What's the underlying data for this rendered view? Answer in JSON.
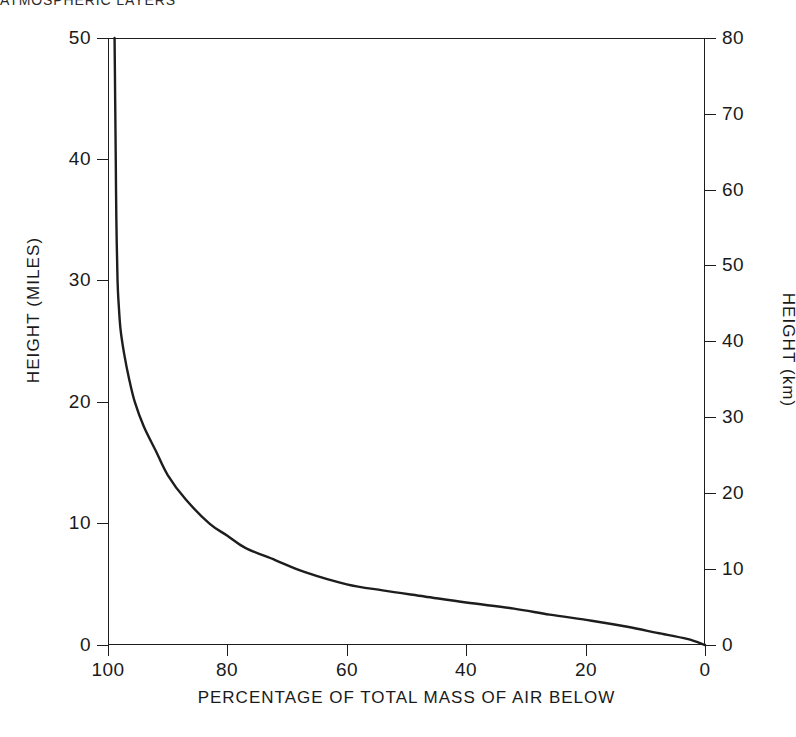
{
  "caption": {
    "text": "ATMOSPHERIC LAYERS"
  },
  "chart_data": {
    "type": "line",
    "title": "",
    "xlabel": "PERCENTAGE OF TOTAL MASS OF AIR BELOW",
    "ylabel": "HEIGHT (MILES)",
    "ylabel_secondary": "HEIGHT (km)",
    "xlim": [
      100,
      0
    ],
    "ylim": [
      0,
      50
    ],
    "ylim_secondary": [
      0,
      80
    ],
    "x_ticks": [
      100,
      80,
      60,
      40,
      20,
      0
    ],
    "x_tick_labels": [
      "100",
      "80",
      "60",
      "40",
      "20",
      "0"
    ],
    "y_ticks_left": [
      0,
      10,
      20,
      30,
      40,
      50
    ],
    "y_tick_labels_left": [
      "0",
      "10",
      "20",
      "30",
      "40",
      "50"
    ],
    "y_ticks_right": [
      0,
      10,
      20,
      30,
      40,
      50,
      60,
      70,
      80
    ],
    "y_tick_labels_right": [
      "0",
      "10",
      "20",
      "30",
      "40",
      "50",
      "60",
      "70",
      "80"
    ],
    "grid": false,
    "legend": "none",
    "line_color": "#1d1d1d",
    "series": [
      {
        "name": "Percentage of total atmospheric mass below a given height",
        "x_label": "percent mass below",
        "y_label": "height (miles)",
        "points": [
          {
            "height_miles": 0,
            "percent_mass_below": 0
          },
          {
            "height_miles": 0.5,
            "percent_mass_below": 3
          },
          {
            "height_miles": 1,
            "percent_mass_below": 8
          },
          {
            "height_miles": 1.5,
            "percent_mass_below": 13
          },
          {
            "height_miles": 2,
            "percent_mass_below": 19
          },
          {
            "height_miles": 2.5,
            "percent_mass_below": 26
          },
          {
            "height_miles": 3,
            "percent_mass_below": 32
          },
          {
            "height_miles": 3.5,
            "percent_mass_below": 40
          },
          {
            "height_miles": 4,
            "percent_mass_below": 47
          },
          {
            "height_miles": 4.5,
            "percent_mass_below": 54
          },
          {
            "height_miles": 5,
            "percent_mass_below": 60
          },
          {
            "height_miles": 6,
            "percent_mass_below": 67
          },
          {
            "height_miles": 7,
            "percent_mass_below": 72
          },
          {
            "height_miles": 8,
            "percent_mass_below": 77
          },
          {
            "height_miles": 9,
            "percent_mass_below": 80
          },
          {
            "height_miles": 10,
            "percent_mass_below": 83
          },
          {
            "height_miles": 12,
            "percent_mass_below": 87
          },
          {
            "height_miles": 14,
            "percent_mass_below": 90
          },
          {
            "height_miles": 16,
            "percent_mass_below": 92
          },
          {
            "height_miles": 18,
            "percent_mass_below": 94
          },
          {
            "height_miles": 20,
            "percent_mass_below": 95.5
          },
          {
            "height_miles": 22,
            "percent_mass_below": 96.5
          },
          {
            "height_miles": 24,
            "percent_mass_below": 97.3
          },
          {
            "height_miles": 26,
            "percent_mass_below": 97.9
          },
          {
            "height_miles": 28,
            "percent_mass_below": 98.2
          },
          {
            "height_miles": 30,
            "percent_mass_below": 98.4
          },
          {
            "height_miles": 35,
            "percent_mass_below": 98.6
          },
          {
            "height_miles": 40,
            "percent_mass_below": 98.7
          },
          {
            "height_miles": 45,
            "percent_mass_below": 98.8
          },
          {
            "height_miles": 50,
            "percent_mass_below": 98.9
          }
        ]
      }
    ]
  }
}
